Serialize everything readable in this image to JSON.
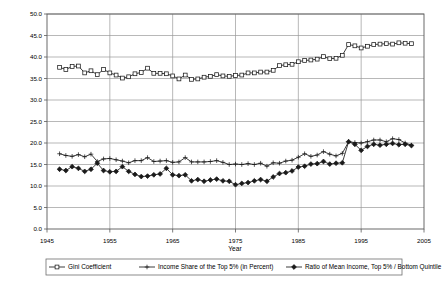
{
  "chart_data": {
    "type": "line",
    "title": "",
    "xlabel": "Year",
    "ylabel": "",
    "xlim": [
      1945,
      2005
    ],
    "ylim": [
      0.0,
      50.0
    ],
    "grid": true,
    "legend_position": "bottom",
    "x_ticks": [
      "1945",
      "1955",
      "1965",
      "1975",
      "1985",
      "1995",
      "2005"
    ],
    "x_tick_values": [
      1945,
      1955,
      1965,
      1975,
      1985,
      1995,
      2005
    ],
    "y_ticks": [
      "0.0",
      "5.0",
      "10.0",
      "15.0",
      "20.0",
      "25.0",
      "30.0",
      "35.0",
      "40.0",
      "45.0",
      "50.0"
    ],
    "y_tick_values": [
      0.0,
      5.0,
      10.0,
      15.0,
      20.0,
      25.0,
      30.0,
      35.0,
      40.0,
      45.0,
      50.0
    ],
    "x": [
      1947,
      1948,
      1949,
      1950,
      1951,
      1952,
      1953,
      1954,
      1955,
      1956,
      1957,
      1958,
      1959,
      1960,
      1961,
      1962,
      1963,
      1964,
      1965,
      1966,
      1967,
      1968,
      1969,
      1970,
      1971,
      1972,
      1973,
      1974,
      1975,
      1976,
      1977,
      1978,
      1979,
      1980,
      1981,
      1982,
      1983,
      1984,
      1985,
      1986,
      1987,
      1988,
      1989,
      1990,
      1991,
      1992,
      1993,
      1994,
      1995,
      1996,
      1997,
      1998,
      1999,
      2000,
      2001,
      2002,
      2003
    ],
    "series": [
      {
        "name": "Gini Coefficient",
        "marker": "square",
        "values": [
          37.6,
          37.1,
          37.8,
          37.9,
          36.3,
          36.8,
          35.9,
          37.1,
          36.3,
          35.8,
          35.1,
          35.4,
          36.1,
          36.4,
          37.4,
          36.2,
          36.2,
          36.1,
          35.6,
          34.9,
          35.8,
          34.8,
          34.9,
          35.3,
          35.5,
          35.9,
          35.6,
          35.5,
          35.7,
          35.8,
          36.3,
          36.3,
          36.5,
          36.5,
          36.9,
          38.0,
          38.2,
          38.3,
          38.9,
          39.2,
          39.3,
          39.5,
          40.1,
          39.6,
          39.7,
          40.4,
          42.9,
          42.6,
          42.1,
          42.5,
          42.9,
          43.0,
          43.1,
          43.0,
          43.3,
          43.2,
          43.1
        ]
      },
      {
        "name": "Income Share of the Top 5% (in Percent)",
        "marker": "plus",
        "values": [
          17.5,
          17.1,
          16.9,
          17.3,
          16.8,
          17.4,
          15.7,
          16.3,
          16.4,
          16.1,
          15.8,
          15.4,
          15.9,
          15.9,
          16.6,
          15.7,
          15.8,
          15.9,
          15.5,
          15.6,
          16.6,
          15.6,
          15.6,
          15.6,
          15.7,
          15.9,
          15.5,
          15.0,
          15.1,
          15.0,
          15.2,
          15.0,
          15.3,
          14.6,
          15.4,
          15.3,
          15.8,
          16.0,
          16.7,
          17.5,
          16.9,
          17.2,
          18.0,
          17.4,
          17.0,
          17.6,
          20.3,
          20.1,
          20.0,
          20.3,
          20.7,
          20.7,
          20.3,
          21.0,
          20.8,
          20.0,
          19.5
        ]
      },
      {
        "name": "Ratio of Mean Income, Top 5% / Bottom Quintile",
        "marker": "diamond",
        "values": [
          13.9,
          13.6,
          14.5,
          14.1,
          13.4,
          13.9,
          15.3,
          13.6,
          13.3,
          13.4,
          14.5,
          13.4,
          12.7,
          12.2,
          12.3,
          12.6,
          12.8,
          14.1,
          12.6,
          12.4,
          12.6,
          11.2,
          11.5,
          11.1,
          11.4,
          11.6,
          11.2,
          11.1,
          10.3,
          10.6,
          10.8,
          11.2,
          11.5,
          11.1,
          12.1,
          12.9,
          13.1,
          13.5,
          14.4,
          14.6,
          15.1,
          15.2,
          15.7,
          15.1,
          15.3,
          15.4,
          20.3,
          19.7,
          18.3,
          19.2,
          19.7,
          19.5,
          19.7,
          19.9,
          19.6,
          19.7,
          19.4
        ]
      }
    ]
  },
  "legend": {
    "items": [
      {
        "label": "Gini Coefficient"
      },
      {
        "label": "Income Share of the Top 5% (in Percent)"
      },
      {
        "label": "Ratio of Mean Income, Top 5% / Bottom Quintile"
      }
    ]
  }
}
